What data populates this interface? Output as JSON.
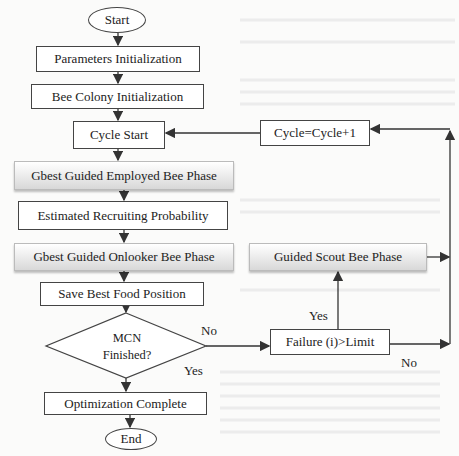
{
  "diagram": {
    "type": "flowchart",
    "nodes": {
      "start": "Start",
      "params": "Parameters Initialization",
      "colony": "Bee Colony Initialization",
      "cycle_start": "Cycle Start",
      "cycle_inc": "Cycle=Cycle+1",
      "employed": "Gbest Guided Employed Bee Phase",
      "recruit": "Estimated Recruiting Probability",
      "onlooker": "Gbest Guided Onlooker Bee Phase",
      "scout": "Guided Scout Bee Phase",
      "save": "Save Best Food Position",
      "decision_line1": "MCN",
      "decision_line2": "Finished?",
      "failure": "Failure (i)>Limit",
      "complete": "Optimization Complete",
      "end": "End"
    },
    "labels": {
      "mcn_no": "No",
      "mcn_yes": "Yes",
      "failure_yes": "Yes",
      "failure_no": "No"
    },
    "colors": {
      "line": "#333333",
      "box_border": "#444444",
      "gradient_top": "#ffffff",
      "gradient_bottom": "#d8d8d8"
    }
  }
}
